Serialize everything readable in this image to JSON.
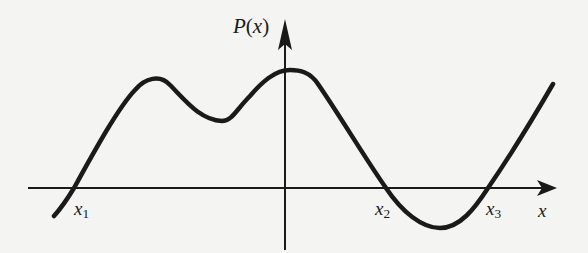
{
  "diagram": {
    "title": "",
    "y_axis": {
      "label_func": "P",
      "label_open": "(",
      "label_var": "x",
      "label_close": ")"
    },
    "x_axis": {
      "label": "x"
    },
    "roots": [
      {
        "name": "x",
        "sub": "1"
      },
      {
        "name": "x",
        "sub": "2"
      },
      {
        "name": "x",
        "sub": "3"
      }
    ],
    "colors": {
      "stroke": "#1a1a1a",
      "background": "#f4f4f2"
    },
    "curve_description": "Polynomial curve P(x) crossing the x-axis at three roots x1, x2, x3, with two local maxima left of/at the y-axis, a local minimum between them, and a minimum below the axis between x2 and x3"
  }
}
